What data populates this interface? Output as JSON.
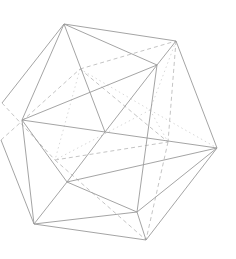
{
  "figure": {
    "colors": {
      "background": "#ffffff",
      "solid_edge": "#9a9a9a",
      "hidden_edge": "#bdbdbd",
      "faint_edge": "#d4d4d4"
    },
    "vertices": {
      "top": [
        64,
        24
      ],
      "top_right": [
        176,
        41
      ],
      "right": [
        217,
        148
      ],
      "bottom_right": [
        146,
        240
      ],
      "bottom_left": [
        34,
        224
      ],
      "left": [
        22,
        120
      ],
      "edge_left_top": [
        2,
        103
      ],
      "edge_left_bottom": [
        1,
        140
      ],
      "inner_a": [
        157,
        65
      ],
      "inner_b": [
        105,
        132
      ],
      "inner_c": [
        67,
        182
      ],
      "inner_d": [
        137,
        212
      ],
      "hidden_a": [
        80,
        69
      ],
      "hidden_b": [
        168,
        142
      ],
      "hidden_c": [
        55,
        160
      ],
      "hidden_d": [
        150,
        110
      ]
    },
    "solid_edges": [
      [
        "top",
        "top_right"
      ],
      [
        "top_right",
        "right"
      ],
      [
        "right",
        "bottom_right"
      ],
      [
        "bottom_right",
        "bottom_left"
      ],
      [
        "bottom_left",
        "edge_left_bottom"
      ],
      [
        "top",
        "edge_left_top"
      ],
      [
        "top",
        "inner_a"
      ],
      [
        "top",
        "inner_b"
      ],
      [
        "top",
        "left"
      ],
      [
        "top_right",
        "inner_a"
      ],
      [
        "inner_a",
        "inner_b"
      ],
      [
        "inner_a",
        "inner_d"
      ],
      [
        "inner_a",
        "left"
      ],
      [
        "inner_b",
        "inner_c"
      ],
      [
        "inner_b",
        "right"
      ],
      [
        "inner_b",
        "left"
      ],
      [
        "left",
        "inner_c"
      ],
      [
        "left",
        "bottom_left"
      ],
      [
        "inner_c",
        "bottom_left"
      ],
      [
        "inner_c",
        "inner_d"
      ],
      [
        "inner_c",
        "right"
      ],
      [
        "inner_d",
        "bottom_right"
      ],
      [
        "inner_d",
        "right"
      ],
      [
        "bottom_left",
        "inner_d"
      ]
    ],
    "dashed_edges": [
      [
        "edge_left_bottom",
        "hidden_a"
      ],
      [
        "hidden_a",
        "top_right"
      ],
      [
        "top_right",
        "hidden_b"
      ],
      [
        "hidden_b",
        "bottom_right"
      ],
      [
        "hidden_a",
        "hidden_b"
      ],
      [
        "edge_left_top",
        "hidden_c"
      ],
      [
        "hidden_c",
        "bottom_right"
      ],
      [
        "hidden_c",
        "hidden_b"
      ]
    ],
    "dotted_edges": [
      [
        "hidden_a",
        "hidden_c"
      ],
      [
        "hidden_a",
        "hidden_d"
      ],
      [
        "hidden_d",
        "hidden_b"
      ],
      [
        "hidden_d",
        "hidden_c"
      ],
      [
        "hidden_d",
        "top_right"
      ],
      [
        "hidden_d",
        "right"
      ]
    ]
  }
}
